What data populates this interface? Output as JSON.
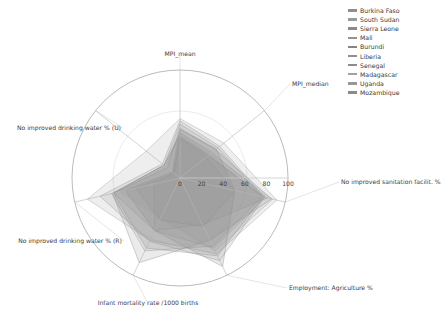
{
  "chart_data": {
    "type": "radar",
    "title": "",
    "grid": true,
    "legend_position": "top-right",
    "rlim": [
      0,
      100
    ],
    "rticks": [
      0,
      20,
      40,
      60,
      80,
      100
    ],
    "rtick_labels": [
      "0",
      "20",
      "40",
      "60",
      "80",
      "100"
    ],
    "categories": [
      "MPI_mean",
      "MPI_median",
      "No improved sanitation facilit. %",
      "Employment: Agriculture %",
      "Infant mortality rate /1000 births",
      "No improved drinking water % (R)",
      "No improved drinking water % (U)"
    ],
    "series": [
      {
        "name": "Burkina Faso",
        "color": "#8e8e8e",
        "values": [
          53,
          47,
          80,
          85,
          65,
          76,
          21
        ]
      },
      {
        "name": "South Sudan",
        "color": "#9a9a9a",
        "values": [
          55,
          52,
          92,
          78,
          64,
          88,
          40
        ]
      },
      {
        "name": "Sierra Leone",
        "color": "#8a8a8a",
        "values": [
          46,
          42,
          87,
          64,
          87,
          64,
          15
        ]
      },
      {
        "name": "Mali",
        "color": "#939393",
        "values": [
          50,
          45,
          78,
          70,
          75,
          65,
          19
        ]
      },
      {
        "name": "Burundi",
        "color": "#858585",
        "values": [
          45,
          43,
          52,
          91,
          54,
          52,
          9
        ]
      },
      {
        "name": "Liberia",
        "color": "#909090",
        "values": [
          42,
          38,
          83,
          48,
          54,
          63,
          19
        ]
      },
      {
        "name": "Senegal",
        "color": "#8c8c8c",
        "values": [
          37,
          31,
          52,
          50,
          43,
          42,
          7
        ]
      },
      {
        "name": "Madagascar",
        "color": "#a2a2a2",
        "values": [
          41,
          36,
          88,
          75,
          41,
          57,
          17
        ]
      },
      {
        "name": "Uganda",
        "color": "#979797",
        "values": [
          37,
          33,
          81,
          72,
          54,
          25,
          8
        ]
      },
      {
        "name": "Mozambique",
        "color": "#8b8b8b",
        "values": [
          39,
          34,
          79,
          80,
          72,
          63,
          19
        ]
      }
    ]
  },
  "legend": {
    "items": [
      {
        "label": "Burkina Faso"
      },
      {
        "label": "South Sudan"
      },
      {
        "label": "Sierra Leone"
      },
      {
        "label": "Mali"
      },
      {
        "label": "Burundi"
      },
      {
        "label": "Liberia"
      },
      {
        "label": "Senegal"
      },
      {
        "label": "Madagascar"
      },
      {
        "label": "Uganda"
      },
      {
        "label": "Mozambique"
      }
    ]
  },
  "style": {
    "grid_color": "#b5b5b5",
    "outer_ring_color": "#9c9c9c",
    "fill_opacity": 0.17,
    "stroke_opacity": 0.55,
    "background": "#ffffff"
  }
}
